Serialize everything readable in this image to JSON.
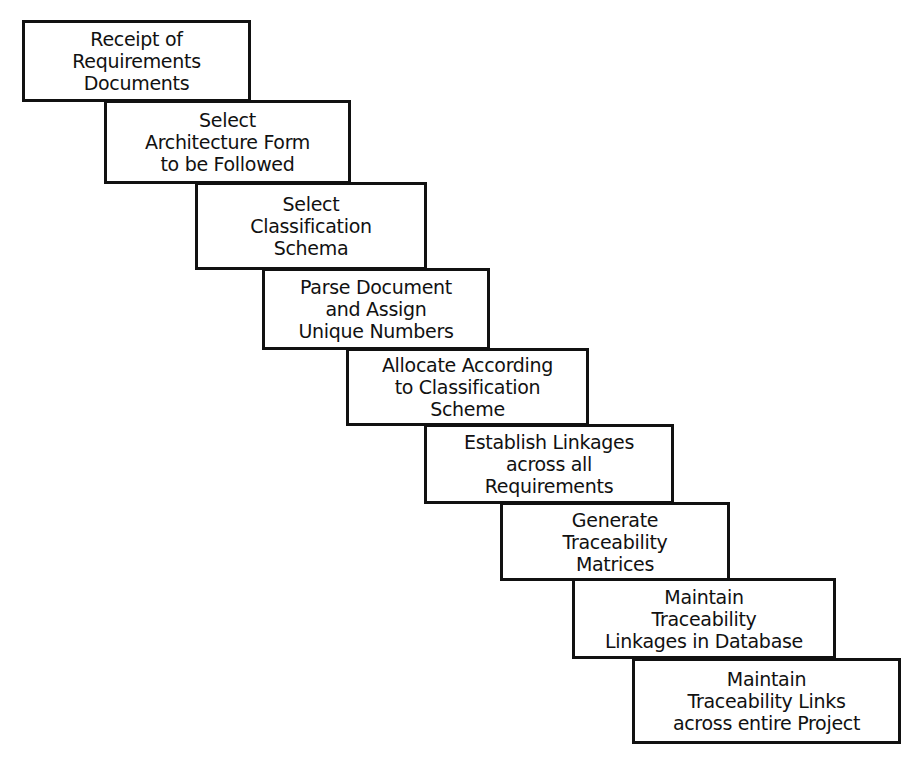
{
  "diagram": {
    "type": "staircase-process",
    "steps": [
      {
        "lines": [
          "Receipt of",
          "Requirements",
          "Documents"
        ],
        "box": [
          22,
          20,
          229,
          82
        ]
      },
      {
        "lines": [
          "Select",
          "Architecture Form",
          "to be Followed"
        ],
        "box": [
          104,
          100,
          247,
          84
        ]
      },
      {
        "lines": [
          "Select",
          "Classification",
          "Schema"
        ],
        "box": [
          195,
          182,
          232,
          88
        ]
      },
      {
        "lines": [
          "Parse Document",
          "and Assign",
          "Unique Numbers"
        ],
        "box": [
          262,
          268,
          228,
          82
        ]
      },
      {
        "lines": [
          "Allocate According",
          "to Classification",
          "Scheme"
        ],
        "box": [
          346,
          348,
          243,
          78
        ]
      },
      {
        "lines": [
          "Establish Linkages",
          "across all",
          "Requirements"
        ],
        "box": [
          424,
          424,
          250,
          80
        ]
      },
      {
        "lines": [
          "Generate",
          "Traceability",
          "Matrices"
        ],
        "box": [
          500,
          502,
          230,
          79
        ]
      },
      {
        "lines": [
          "Maintain",
          "Traceability",
          "Linkages in Database"
        ],
        "box": [
          572,
          578,
          264,
          81
        ]
      },
      {
        "lines": [
          "Maintain",
          "Traceability Links",
          "across entire Project"
        ],
        "box": [
          632,
          658,
          269,
          86
        ]
      }
    ]
  }
}
